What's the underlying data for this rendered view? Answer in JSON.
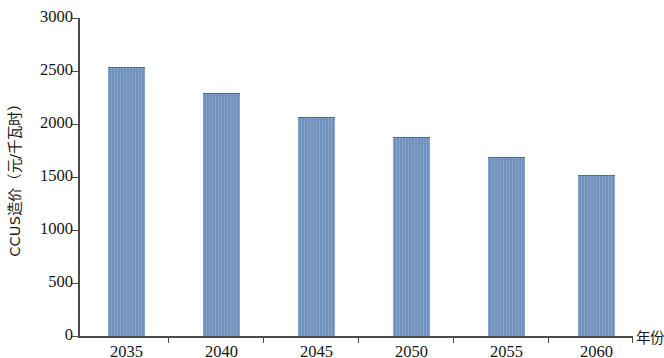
{
  "chart_data": {
    "type": "bar",
    "title": "",
    "subtitle": "",
    "xlabel": "年份",
    "ylabel": "CCUS造价（元/千瓦时）",
    "categories": [
      "2035",
      "2040",
      "2045",
      "2050",
      "2055",
      "2060"
    ],
    "values": [
      2540,
      2290,
      2070,
      1880,
      1690,
      1520
    ],
    "series": [
      {
        "name": "CCUS造价",
        "values": [
          2540,
          2290,
          2070,
          1880,
          1690,
          1520
        ]
      }
    ],
    "ylim": [
      0,
      3000
    ],
    "y_ticks": [
      0,
      500,
      1000,
      1500,
      2000,
      2500,
      3000
    ],
    "y_tick_labels": [
      "0",
      "500",
      "1000",
      "1500",
      "2000",
      "2500",
      "3000"
    ],
    "x_tick_labels": [
      "2035",
      "2040",
      "2045",
      "2050",
      "2055",
      "2060"
    ],
    "grid": false,
    "legend": null,
    "legend_position": "none",
    "bar_color": "#6f92c2",
    "axis_color": "#4a4a4a",
    "background_color": "#ffffff",
    "annotations": []
  }
}
